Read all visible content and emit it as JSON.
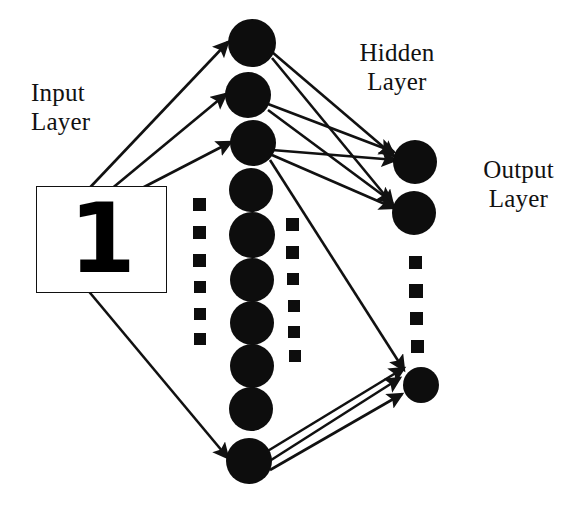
{
  "diagram": {
    "background_color": "#ffffff",
    "ink_color": "#111111",
    "node_fill": "#0d0d0d",
    "width": 577,
    "height": 508
  },
  "labels": {
    "input": "Input\nLayer",
    "hidden": "Hidden\nLayer",
    "output": "Output\nLayer"
  },
  "input_box": {
    "digit": "1",
    "border_color": "#111111",
    "fill": "#ffffff"
  },
  "layers": {
    "input": {
      "name": "Input Layer",
      "representation": "image-patch",
      "node_count": 1
    },
    "hidden": {
      "name": "Hidden Layer",
      "node_count": 10,
      "node_radius": 22,
      "nodes": [
        {
          "cx": 252,
          "cy": 43,
          "r": 24
        },
        {
          "cx": 248,
          "cy": 95,
          "r": 23
        },
        {
          "cx": 253,
          "cy": 143,
          "r": 23
        },
        {
          "cx": 251,
          "cy": 190,
          "r": 22
        },
        {
          "cx": 252,
          "cy": 235,
          "r": 23
        },
        {
          "cx": 252,
          "cy": 280,
          "r": 22
        },
        {
          "cx": 252,
          "cy": 323,
          "r": 22
        },
        {
          "cx": 252,
          "cy": 366,
          "r": 22
        },
        {
          "cx": 251,
          "cy": 409,
          "r": 22
        },
        {
          "cx": 249,
          "cy": 461,
          "r": 23
        }
      ]
    },
    "output": {
      "name": "Output Layer",
      "node_count": 3,
      "nodes": [
        {
          "cx": 415,
          "cy": 162,
          "r": 22
        },
        {
          "cx": 414,
          "cy": 213,
          "r": 22
        },
        {
          "cx": 421,
          "cy": 385,
          "r": 18
        }
      ]
    }
  },
  "ellipsis_columns": [
    {
      "name": "hidden-left-ellipsis",
      "squares": [
        {
          "x": 193,
          "y": 198,
          "size": 13
        },
        {
          "x": 193,
          "y": 226,
          "size": 13
        },
        {
          "x": 193,
          "y": 254,
          "size": 13
        },
        {
          "x": 194,
          "y": 281,
          "size": 12
        },
        {
          "x": 194,
          "y": 308,
          "size": 12
        },
        {
          "x": 194,
          "y": 333,
          "size": 12
        }
      ]
    },
    {
      "name": "hidden-right-ellipsis",
      "squares": [
        {
          "x": 286,
          "y": 218,
          "size": 13
        },
        {
          "x": 286,
          "y": 246,
          "size": 13
        },
        {
          "x": 287,
          "y": 273,
          "size": 12
        },
        {
          "x": 288,
          "y": 300,
          "size": 12
        },
        {
          "x": 288,
          "y": 326,
          "size": 12
        },
        {
          "x": 289,
          "y": 350,
          "size": 12
        }
      ]
    },
    {
      "name": "output-ellipsis",
      "squares": [
        {
          "x": 409,
          "y": 256,
          "size": 13
        },
        {
          "x": 409,
          "y": 284,
          "size": 14
        },
        {
          "x": 410,
          "y": 312,
          "size": 13
        },
        {
          "x": 411,
          "y": 340,
          "size": 13
        }
      ]
    }
  ],
  "connections": {
    "input_to_hidden": [
      {
        "x1": 80,
        "y1": 198,
        "x2": 228,
        "y2": 42
      },
      {
        "x1": 98,
        "y1": 200,
        "x2": 226,
        "y2": 94
      },
      {
        "x1": 115,
        "y1": 202,
        "x2": 231,
        "y2": 142
      },
      {
        "x1": 86,
        "y1": 288,
        "x2": 228,
        "y2": 458
      }
    ],
    "hidden_to_output": [
      {
        "x1": 272,
        "y1": 52,
        "x2": 394,
        "y2": 156
      },
      {
        "x1": 272,
        "y1": 58,
        "x2": 393,
        "y2": 205
      },
      {
        "x1": 268,
        "y1": 104,
        "x2": 394,
        "y2": 152
      },
      {
        "x1": 268,
        "y1": 110,
        "x2": 392,
        "y2": 202
      },
      {
        "x1": 272,
        "y1": 150,
        "x2": 396,
        "y2": 160
      },
      {
        "x1": 272,
        "y1": 155,
        "x2": 394,
        "y2": 208
      },
      {
        "x1": 270,
        "y1": 160,
        "x2": 404,
        "y2": 370
      },
      {
        "x1": 266,
        "y1": 452,
        "x2": 404,
        "y2": 368
      },
      {
        "x1": 268,
        "y1": 462,
        "x2": 400,
        "y2": 378
      },
      {
        "x1": 270,
        "y1": 470,
        "x2": 402,
        "y2": 394
      }
    ]
  }
}
